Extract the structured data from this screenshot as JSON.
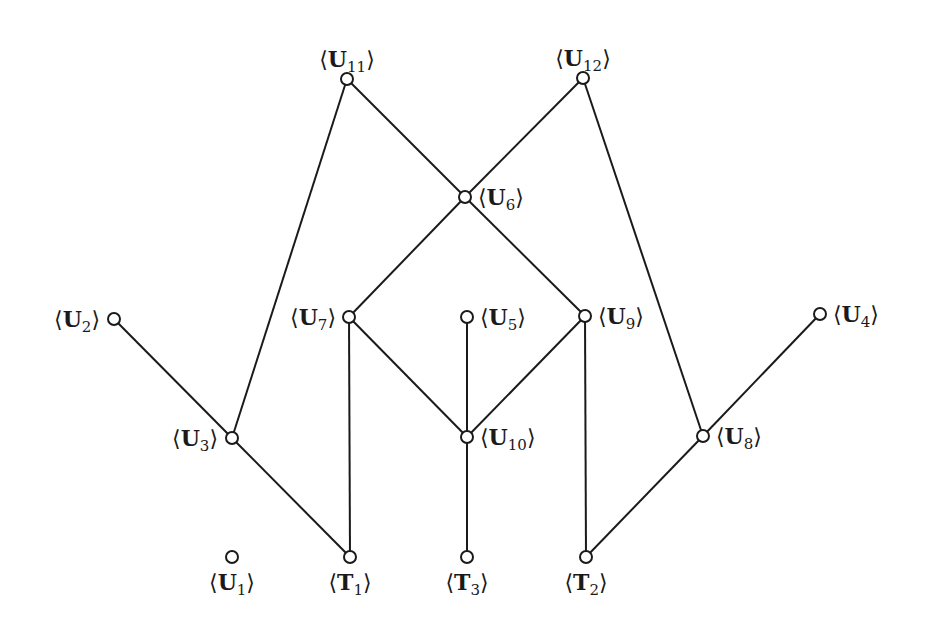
{
  "diagram": {
    "type": "hasse-diagram",
    "nodes": [
      {
        "id": "U11",
        "letter": "U",
        "index": "11"
      },
      {
        "id": "U12",
        "letter": "U",
        "index": "12"
      },
      {
        "id": "U6",
        "letter": "U",
        "index": "6"
      },
      {
        "id": "U2",
        "letter": "U",
        "index": "2"
      },
      {
        "id": "U7",
        "letter": "U",
        "index": "7"
      },
      {
        "id": "U5",
        "letter": "U",
        "index": "5"
      },
      {
        "id": "U9",
        "letter": "U",
        "index": "9"
      },
      {
        "id": "U4",
        "letter": "U",
        "index": "4"
      },
      {
        "id": "U3",
        "letter": "U",
        "index": "3"
      },
      {
        "id": "U10",
        "letter": "U",
        "index": "10"
      },
      {
        "id": "U8",
        "letter": "U",
        "index": "8"
      },
      {
        "id": "U1",
        "letter": "U",
        "index": "1"
      },
      {
        "id": "T1",
        "letter": "T",
        "index": "1"
      },
      {
        "id": "T3",
        "letter": "T",
        "index": "3"
      },
      {
        "id": "T2",
        "letter": "T",
        "index": "2"
      }
    ],
    "edges": [
      [
        "U11",
        "U3"
      ],
      [
        "U11",
        "U6"
      ],
      [
        "U12",
        "U6"
      ],
      [
        "U12",
        "U8"
      ],
      [
        "U6",
        "U7"
      ],
      [
        "U6",
        "U9"
      ],
      [
        "U2",
        "U3"
      ],
      [
        "U3",
        "T1"
      ],
      [
        "U7",
        "T1"
      ],
      [
        "U7",
        "U10"
      ],
      [
        "U5",
        "U10"
      ],
      [
        "U9",
        "U10"
      ],
      [
        "U9",
        "T2"
      ],
      [
        "U10",
        "T3"
      ],
      [
        "U4",
        "U8"
      ],
      [
        "U8",
        "T2"
      ]
    ],
    "bracket_open": "⟨",
    "bracket_close": "⟩"
  }
}
